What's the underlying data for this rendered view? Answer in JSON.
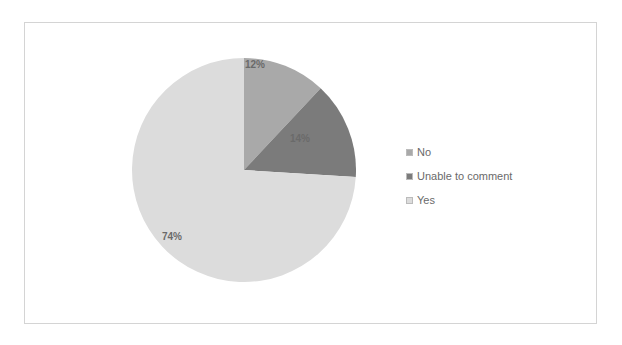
{
  "chart_data": {
    "type": "pie",
    "title": "",
    "categories": [
      "No",
      "Unable to comment",
      "Yes"
    ],
    "values": [
      12,
      14,
      74
    ],
    "labels": [
      "12%",
      "14%",
      "74%"
    ],
    "colors": [
      "#a9a9a9",
      "#7b7b7b",
      "#dcdcdc"
    ],
    "start_angle_deg": 0,
    "direction": "clockwise",
    "legend_position": "right"
  },
  "legend": {
    "items": [
      {
        "label": "No",
        "color": "#a9a9a9"
      },
      {
        "label": "Unable to comment",
        "color": "#7b7b7b"
      },
      {
        "label": "Yes",
        "color": "#dcdcdc"
      }
    ]
  }
}
